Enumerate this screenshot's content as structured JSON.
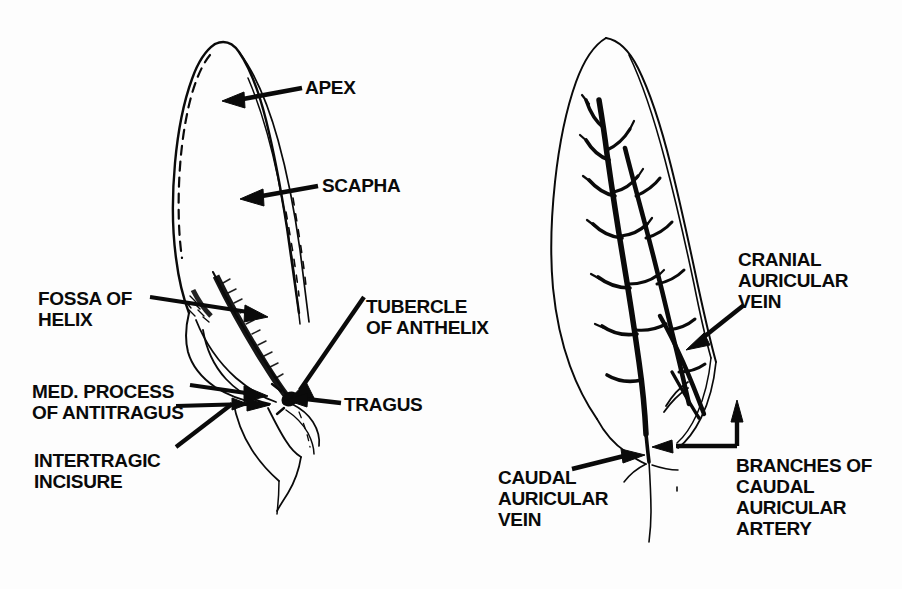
{
  "figure": {
    "background_color": "#fdfdfd",
    "ink_color": "#0a0a0a",
    "panels": [
      {
        "id": "left-panel",
        "name": "medial-surface-landmarks",
        "description": "Medial (inner) surface of the canine pinna showing cartilage landmarks"
      },
      {
        "id": "right-panel",
        "name": "auricular-vasculature",
        "description": "Same pinna showing branching auricular veins and arteries"
      }
    ]
  },
  "labels": {
    "apex": {
      "text": "APEX",
      "lines": [
        "APEX"
      ],
      "panel": "left-panel",
      "x": 305,
      "y": 77
    },
    "scapha": {
      "text": "SCAPHA",
      "lines": [
        "SCAPHA"
      ],
      "panel": "left-panel",
      "x": 322,
      "y": 175
    },
    "fossa_of_helix": {
      "text": "FOSSA OF HELIX",
      "lines": [
        "FOSSA OF",
        "HELIX"
      ],
      "panel": "left-panel",
      "x": 38,
      "y": 288
    },
    "tubercle_of_anthelix": {
      "text": "TUBERCLE OF ANTHELIX",
      "lines": [
        "TUBERCLE",
        "OF ANTHELIX"
      ],
      "panel": "left-panel",
      "x": 366,
      "y": 296
    },
    "med_process_of_antitragus": {
      "text": "MED. PROCESS OF ANTITRAGUS",
      "lines": [
        "MED. PROCESS",
        "OF ANTITRAGUS"
      ],
      "panel": "left-panel",
      "x": 32,
      "y": 381
    },
    "tragus": {
      "text": "TRAGUS",
      "lines": [
        "TRAGUS"
      ],
      "panel": "left-panel",
      "x": 344,
      "y": 394
    },
    "intertragic_incisure": {
      "text": "INTERTRAGIC INCISURE",
      "lines": [
        "INTERTRAGIC",
        "INCISURE"
      ],
      "panel": "left-panel",
      "x": 34,
      "y": 450
    },
    "cranial_auricular_vein": {
      "text": "CRANIAL AURICULAR VEIN",
      "lines": [
        "CRANIAL",
        "AURICULAR",
        "VEIN"
      ],
      "panel": "right-panel",
      "x": 738,
      "y": 249
    },
    "caudal_auricular_vein": {
      "text": "CAUDAL AURICULAR VEIN",
      "lines": [
        "CAUDAL",
        "AURICULAR",
        "VEIN"
      ],
      "panel": "right-panel",
      "x": 498,
      "y": 467
    },
    "branches_of_caudal_auricular_artery": {
      "text": "BRANCHES OF CAUDAL AURICULAR ARTERY",
      "lines": [
        "BRANCHES OF",
        "CAUDAL",
        "AURICULAR",
        "ARTERY"
      ],
      "panel": "right-panel",
      "x": 736,
      "y": 455
    }
  },
  "leaders": {
    "apex": {
      "from": [
        300,
        88
      ],
      "to": [
        228,
        101
      ],
      "arrowhead": "to"
    },
    "scapha": {
      "from": [
        318,
        186
      ],
      "to": [
        245,
        198
      ],
      "arrowhead": "to"
    },
    "fossa_of_helix": {
      "from": [
        150,
        297
      ],
      "to": [
        262,
        316
      ],
      "arrowhead": "to"
    },
    "tubercle_of_anthelix": {
      "from": [
        364,
        298
      ],
      "to": [
        292,
        398
      ],
      "arrowhead": "to"
    },
    "med_process_of_antitragus": {
      "from": [
        190,
        385
      ],
      "to": [
        262,
        396
      ],
      "arrowhead": "to"
    },
    "tragus": {
      "from": [
        340,
        404
      ],
      "to": [
        289,
        403
      ],
      "arrowhead": "to"
    },
    "intertragic_incisure": {
      "from": [
        176,
        447
      ],
      "to": [
        268,
        409
      ],
      "arrowhead": "to"
    },
    "cranial_auricular_vein": {
      "from": [
        742,
        307
      ],
      "to": [
        688,
        345
      ],
      "arrowhead": "to"
    },
    "caudal_auricular_vein": {
      "from": [
        572,
        469
      ],
      "to": [
        637,
        455
      ],
      "arrowhead": "to"
    },
    "branches_of_caudal_auricular_artery": {
      "from": [
        736,
        452
      ],
      "to": [
        700,
        450
      ],
      "arrowhead": "to"
    }
  },
  "colors": {
    "ink": "#0a0a0a",
    "paper": "#fdfdfd"
  }
}
